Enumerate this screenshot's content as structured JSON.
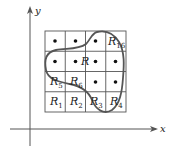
{
  "diagram": {
    "axes": {
      "x_label": "x",
      "y_label": "y"
    },
    "grid": {
      "rows": 4,
      "cols": 4,
      "origin_px": [
        45,
        31
      ],
      "cell_px": 20.25,
      "line_color": "#555555"
    },
    "region": {
      "label": "R",
      "stroke_color": "#555555"
    },
    "cell_labels": [
      {
        "id": "R1",
        "base": "R",
        "sub": "1",
        "col": 0,
        "row": 3
      },
      {
        "id": "R2",
        "base": "R",
        "sub": "2",
        "col": 1,
        "row": 3
      },
      {
        "id": "R3",
        "base": "R",
        "sub": "3",
        "col": 2,
        "row": 3
      },
      {
        "id": "R4",
        "base": "R",
        "sub": "4",
        "col": 3,
        "row": 3
      },
      {
        "id": "R5",
        "base": "R",
        "sub": "5",
        "col": 0,
        "row": 2
      },
      {
        "id": "R6",
        "base": "R",
        "sub": "6",
        "col": 1,
        "row": 2
      },
      {
        "id": "R16",
        "base": "R",
        "sub": "16",
        "col": 3,
        "row": 0
      }
    ],
    "sample_points": [
      {
        "col": 0,
        "row": 0
      },
      {
        "col": 1,
        "row": 0
      },
      {
        "col": 2,
        "row": 0
      },
      {
        "col": 0,
        "row": 1
      },
      {
        "col": 1,
        "row": 1
      },
      {
        "col": 2,
        "row": 1
      },
      {
        "col": 3,
        "row": 1
      },
      {
        "col": 2,
        "row": 2
      },
      {
        "col": 3,
        "row": 2
      }
    ]
  }
}
